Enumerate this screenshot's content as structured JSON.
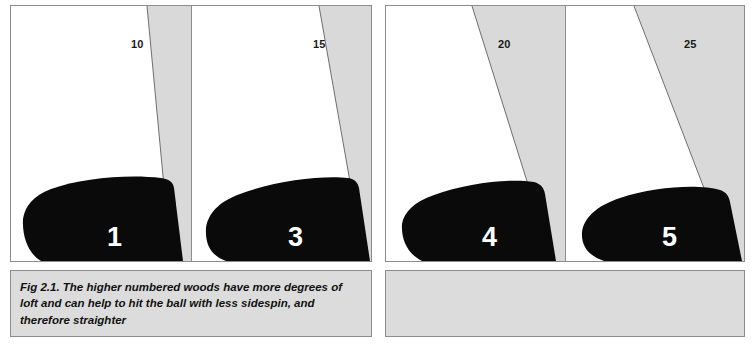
{
  "figure": {
    "caption": "Fig 2.1. The higher numbered woods have more degrees of loft and can help to hit the ball with less sidespin, and therefore straighter",
    "colors": {
      "loft_wedge_fill": "#d9d9d9",
      "club_head_fill": "#0a0a0a",
      "panel_background": "#ffffff",
      "border": "#8c8c8c",
      "caption_background": "#dcdcdc",
      "number_text": "#ffffff",
      "loft_label_text": "#1a1a1a"
    }
  },
  "groups": [
    {
      "id": "group-left",
      "panels": [
        {
          "club_number": "1",
          "loft_degrees": "10"
        },
        {
          "club_number": "3",
          "loft_degrees": "15"
        }
      ]
    },
    {
      "id": "group-right",
      "panels": [
        {
          "club_number": "4",
          "loft_degrees": "20"
        },
        {
          "club_number": "5",
          "loft_degrees": "25"
        }
      ]
    }
  ]
}
